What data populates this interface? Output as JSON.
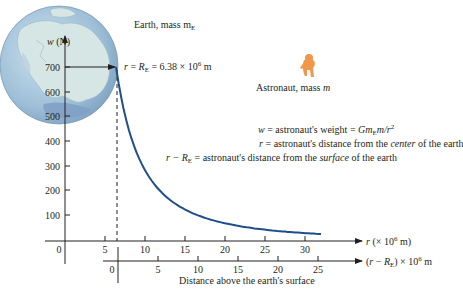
{
  "labels": {
    "earth": "Earth, mass m",
    "earth_sub": "E",
    "astronaut": "Astronaut, mass ",
    "astronaut_m": "m",
    "y_axis_title_w": "w",
    "y_axis_title_unit": " (N)",
    "re_annotation": {
      "r": "r",
      "eq": " = ",
      "R": "R",
      "sub": "E",
      "value": " = 6.38 × 10",
      "exp": "6",
      "unit": " m"
    },
    "legend": [
      {
        "lhs": "w",
        "rhs_plain": " = astronaut's weight = ",
        "rhs_formula": "Gm",
        "formula_sub": "E",
        "formula_tail": "m/r",
        "formula_exp": "2"
      },
      {
        "lhs": "r",
        "rhs_plain": " = astronaut's distance from the ",
        "emph": "center",
        "tail": " of the earth"
      },
      {
        "lhs": "r − R",
        "lhs_sub": "E",
        "rhs_plain": " = astronaut's distance from the ",
        "emph": "surface",
        "tail": " of the earth"
      }
    ],
    "r_axis_label": {
      "var": "r",
      "text": " (× 10",
      "exp": "6",
      "unit": " m)"
    },
    "h_axis_label": {
      "open": "(",
      "var": "r",
      "minus": " − ",
      "R": "R",
      "sub": "E",
      "close": ") × 10",
      "exp": "6",
      "unit": " m"
    },
    "h_axis_caption": "Distance above the earth's surface"
  },
  "colors": {
    "curve": "#1f4e8c",
    "earth_ocean": "#a9c8dc",
    "earth_land": "#d5e6e4",
    "astronaut": "#f0974a",
    "axis": "#231f20"
  },
  "chart_data": {
    "type": "line",
    "title": "",
    "xlabel": "r (× 10^6 m)",
    "x2label": "(r − R_E) × 10^6 m — Distance above the earth's surface",
    "ylabel": "w (N)",
    "x_ticks": [
      0,
      5,
      10,
      15,
      20,
      25,
      30
    ],
    "x2_ticks": [
      0,
      5,
      10,
      15,
      20,
      25
    ],
    "y_ticks": [
      100,
      200,
      300,
      400,
      500,
      600,
      700
    ],
    "y_zero_label": "0",
    "xlim": [
      0,
      34
    ],
    "ylim": [
      0,
      750
    ],
    "grid": false,
    "annotations": [
      "r = R_E = 6.38 × 10^6 m",
      "dashed vertical line at r = R_E",
      "horizontal arrow at w = 700 N"
    ],
    "series": [
      {
        "name": "w = G m_E m / r^2",
        "x": [
          6.38,
          7,
          8,
          9,
          10,
          11,
          12,
          14,
          16,
          18,
          20,
          22,
          24,
          26,
          28,
          30,
          32
        ],
        "values": [
          700,
          581,
          445,
          352,
          285,
          235,
          198,
          145,
          111,
          88,
          71,
          59,
          49,
          42,
          36,
          32,
          28
        ]
      }
    ]
  }
}
